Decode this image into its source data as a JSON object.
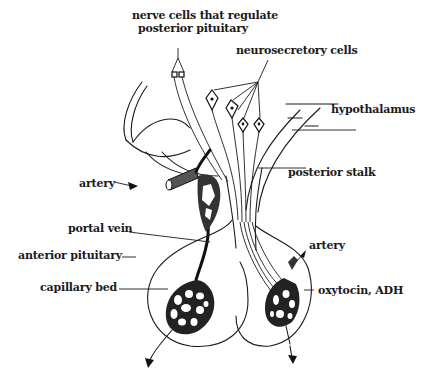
{
  "diagram": {
    "labels": {
      "nerve_cells_line1": "nerve cells that regulate",
      "nerve_cells_line2": "posterior pituitary",
      "neurosecretory_cells": "neurosecretory cells",
      "hypothalamus": "hypothalamus",
      "posterior_stalk": "posterior stalk",
      "artery_left": "artery",
      "artery_right": "artery",
      "portal_vein": "portal vein",
      "anterior_pituitary": "anterior pituitary",
      "capillary_bed": "capillary bed",
      "oxytocin_adh": "oxytocin, ADH"
    },
    "colors": {
      "ink": "#1a1a1a",
      "background": "#ffffff"
    }
  }
}
